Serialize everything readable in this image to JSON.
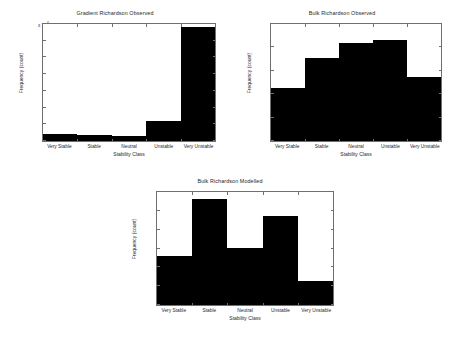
{
  "chart_data": [
    {
      "id": "gradient-observed",
      "type": "bar",
      "title": "Gradient Richardson Observed",
      "xlabel": "Stability Class",
      "ylabel": "Frequency (count)",
      "categories": [
        "Very Stable",
        "Stable",
        "Neutral",
        "Unstable",
        "Very Unstable"
      ],
      "values": [
        2000,
        1900,
        1400,
        5900,
        34000
      ],
      "ylim": [
        0,
        35000
      ],
      "yticks": [
        0,
        5000,
        10000,
        15000,
        20000,
        25000,
        30000,
        35000
      ],
      "ytick_labels": [
        "0",
        "0.5",
        "1",
        "1.5",
        "2",
        "2.5",
        "3",
        "3.5"
      ],
      "y_exponent_label": "x 10",
      "y_exponent_power": "4",
      "grid": false,
      "legend": "none",
      "bar_color": "#000000"
    },
    {
      "id": "bulk-observed",
      "type": "bar",
      "title": "Bulk Richardson Observed",
      "xlabel": "Stability Class",
      "ylabel": "Frequency (count)",
      "categories": [
        "Very Stable",
        "Stable",
        "Neutral",
        "Unstable",
        "Very Unstable"
      ],
      "values": [
        4500,
        7100,
        8400,
        8600,
        5500
      ],
      "ylim": [
        0,
        10000
      ],
      "yticks": [
        0,
        2000,
        4000,
        6000,
        8000,
        10000
      ],
      "ytick_labels": [
        "0",
        "2000",
        "4000",
        "6000",
        "8000",
        "10000"
      ],
      "grid": false,
      "legend": "none",
      "bar_color": "#000000"
    },
    {
      "id": "bulk-modelled",
      "type": "bar",
      "title": "Bulk Richardson Modelled",
      "xlabel": "Stability Class",
      "ylabel": "Frequency (count)",
      "categories": [
        "Very Stable",
        "Stable",
        "Neutral",
        "Unstable",
        "Very Unstable"
      ],
      "values": [
        5200,
        11300,
        6050,
        9400,
        2550
      ],
      "ylim": [
        0,
        12000
      ],
      "yticks": [
        0,
        2000,
        4000,
        6000,
        8000,
        10000,
        12000
      ],
      "ytick_labels": [
        "0",
        "2000",
        "4000",
        "6000",
        "8000",
        "10000",
        "12000"
      ],
      "grid": false,
      "legend": "none",
      "bar_color": "#000000"
    }
  ]
}
